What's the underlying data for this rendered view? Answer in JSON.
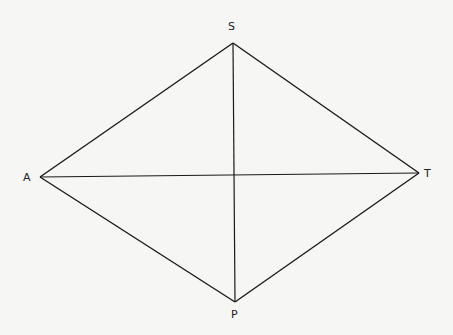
{
  "diagram": {
    "type": "quadrilateral-with-diagonals",
    "background": "#f6f6f4",
    "stroke_color": "#1a1a1a",
    "vertices": {
      "S": {
        "label": "S",
        "x": 233,
        "y": 43,
        "label_x": 232,
        "label_y": 30
      },
      "A": {
        "label": "A",
        "x": 40,
        "y": 177,
        "label_x": 27,
        "label_y": 181
      },
      "T": {
        "label": "T",
        "x": 419,
        "y": 173,
        "label_x": 424,
        "label_y": 177
      },
      "P": {
        "label": "P",
        "x": 235,
        "y": 302,
        "label_x": 231,
        "label_y": 318
      }
    },
    "edges": [
      [
        "S",
        "A"
      ],
      [
        "S",
        "T"
      ],
      [
        "A",
        "P"
      ],
      [
        "T",
        "P"
      ]
    ],
    "diagonals": [
      [
        "S",
        "P"
      ],
      [
        "A",
        "T"
      ]
    ]
  }
}
